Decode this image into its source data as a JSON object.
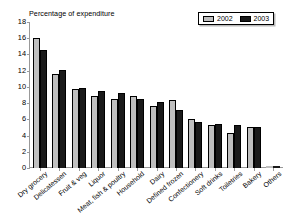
{
  "chart_data": {
    "type": "bar",
    "title": "Percentage of expenditure",
    "xlabel": "",
    "ylabel": "",
    "ylim": [
      0,
      18
    ],
    "yticks": [
      18,
      16,
      14,
      12,
      10,
      8,
      6,
      4,
      2,
      0
    ],
    "grid": false,
    "legend_position": "top-right",
    "categories": [
      "Dry grocery",
      "Delicatessen",
      "Fruit & veg",
      "Liquor",
      "Meat, fish & poultry",
      "Household",
      "Dairy",
      "Defined frozen",
      "Confectionery",
      "Soft drinks",
      "Toiletries",
      "Bakery",
      "Others"
    ],
    "series": [
      {
        "name": "2002",
        "color": "#bfbfbf",
        "values": [
          16.0,
          11.6,
          9.7,
          8.9,
          8.5,
          8.9,
          7.7,
          8.4,
          6.1,
          5.3,
          4.3,
          5.1,
          0.2
        ]
      },
      {
        "name": "2003",
        "color": "#1a1a1a",
        "values": [
          14.5,
          12.1,
          9.9,
          9.5,
          9.2,
          8.5,
          8.2,
          7.2,
          5.7,
          5.4,
          5.3,
          5.0,
          0.2
        ]
      }
    ]
  },
  "legend": {
    "entries": [
      {
        "label": "2002",
        "color": "#bfbfbf"
      },
      {
        "label": "2003",
        "color": "#1a1a1a"
      }
    ]
  }
}
